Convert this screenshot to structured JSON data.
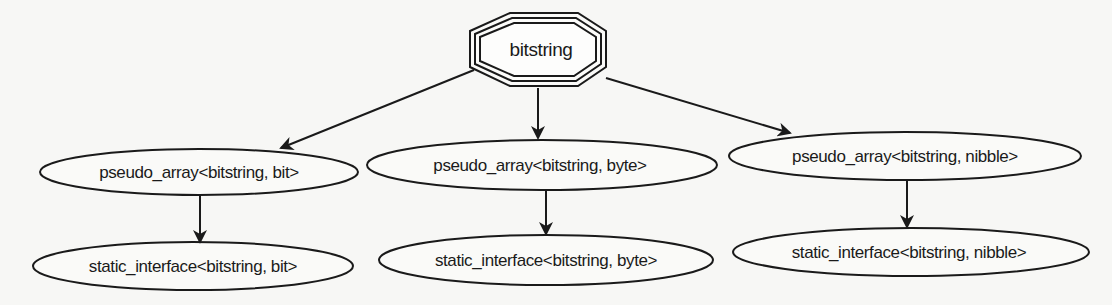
{
  "diagram": {
    "type": "class-hierarchy",
    "colors": {
      "background": "#f7f7f5",
      "stroke": "#1a1a1a",
      "text": "#1a1a1a"
    },
    "root": {
      "id": "bitstring",
      "label": "bitstring",
      "shape": "triple-octagon"
    },
    "nodes": [
      {
        "id": "pa_bit",
        "label": "pseudo_array<bitstring, bit>",
        "shape": "ellipse"
      },
      {
        "id": "pa_byte",
        "label": "pseudo_array<bitstring, byte>",
        "shape": "ellipse"
      },
      {
        "id": "pa_nibble",
        "label": "pseudo_array<bitstring, nibble>",
        "shape": "ellipse"
      },
      {
        "id": "si_bit",
        "label": "static_interface<bitstring, bit>",
        "shape": "ellipse"
      },
      {
        "id": "si_byte",
        "label": "static_interface<bitstring, byte>",
        "shape": "ellipse"
      },
      {
        "id": "si_nibble",
        "label": "static_interface<bitstring, nibble>",
        "shape": "ellipse"
      }
    ],
    "edges": [
      {
        "from": "bitstring",
        "to": "pa_bit"
      },
      {
        "from": "bitstring",
        "to": "pa_byte"
      },
      {
        "from": "bitstring",
        "to": "pa_nibble"
      },
      {
        "from": "pa_bit",
        "to": "si_bit"
      },
      {
        "from": "pa_byte",
        "to": "si_byte"
      },
      {
        "from": "pa_nibble",
        "to": "si_nibble"
      }
    ]
  }
}
